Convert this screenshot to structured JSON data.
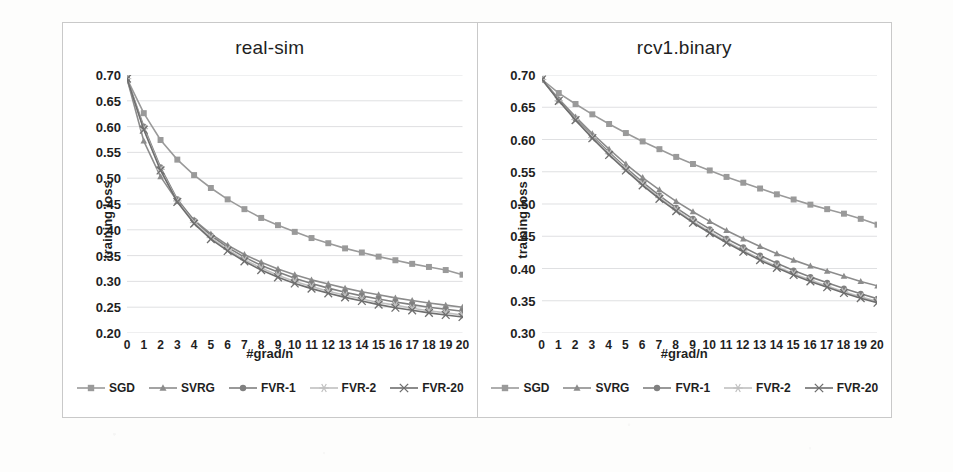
{
  "figure": {
    "panel_border_color": "#c9c9c9",
    "background": "#ffffff"
  },
  "series_style": {
    "SGD": {
      "color": "#9a9a9a",
      "marker": "square-marker"
    },
    "SVRG": {
      "color": "#8c8c8c",
      "marker": "triangle-marker"
    },
    "FVR-1": {
      "color": "#808080",
      "marker": "circle-marker"
    },
    "FVR-2": {
      "color": "#c0c0c0",
      "marker": "star-marker"
    },
    "FVR-20": {
      "color": "#6e6e6e",
      "marker": "x-marker"
    }
  },
  "legend": {
    "items": [
      {
        "label": "SGD",
        "marker": "square-marker",
        "color": "#9a9a9a"
      },
      {
        "label": "SVRG",
        "marker": "triangle-marker",
        "color": "#8c8c8c"
      },
      {
        "label": "FVR-1",
        "marker": "circle-marker",
        "color": "#808080"
      },
      {
        "label": "FVR-2",
        "marker": "star-marker",
        "color": "#c0c0c0"
      },
      {
        "label": "FVR-20",
        "marker": "x-marker",
        "color": "#6e6e6e"
      }
    ]
  },
  "chart_data": [
    {
      "type": "line",
      "title": "real-sim",
      "xlabel": "#grad/n",
      "ylabel": "training loss",
      "x": [
        0,
        1,
        2,
        3,
        4,
        5,
        6,
        7,
        8,
        9,
        10,
        11,
        12,
        13,
        14,
        15,
        16,
        17,
        18,
        19,
        20
      ],
      "xlim": [
        0,
        20
      ],
      "ylim": [
        0.2,
        0.7
      ],
      "yticks": [
        0.2,
        0.25,
        0.3,
        0.35,
        0.4,
        0.45,
        0.5,
        0.55,
        0.6,
        0.65,
        0.7
      ],
      "ytick_labels": [
        "0.20",
        "0.25",
        "0.30",
        "0.35",
        "0.40",
        "0.45",
        "0.50",
        "0.55",
        "0.60",
        "0.65",
        "0.70"
      ],
      "xtick_labels": [
        "0",
        "1",
        "2",
        "3",
        "4",
        "5",
        "6",
        "7",
        "8",
        "9",
        "10",
        "11",
        "12",
        "13",
        "14",
        "15",
        "16",
        "17",
        "18",
        "19",
        "20"
      ],
      "grid": true,
      "legend_position": "bottom",
      "series": [
        {
          "name": "SGD",
          "values": [
            0.693,
            0.626,
            0.574,
            0.536,
            0.506,
            0.481,
            0.459,
            0.44,
            0.423,
            0.409,
            0.396,
            0.384,
            0.374,
            0.364,
            0.356,
            0.348,
            0.341,
            0.334,
            0.328,
            0.322,
            0.313
          ]
        },
        {
          "name": "SVRG",
          "values": [
            0.693,
            0.572,
            0.503,
            0.455,
            0.419,
            0.392,
            0.37,
            0.352,
            0.337,
            0.324,
            0.313,
            0.303,
            0.295,
            0.287,
            0.28,
            0.274,
            0.268,
            0.263,
            0.258,
            0.254,
            0.25
          ]
        },
        {
          "name": "FVR-1",
          "values": [
            0.693,
            0.6,
            0.521,
            0.459,
            0.418,
            0.389,
            0.366,
            0.347,
            0.331,
            0.318,
            0.306,
            0.296,
            0.287,
            0.279,
            0.272,
            0.266,
            0.26,
            0.255,
            0.25,
            0.246,
            0.242
          ]
        },
        {
          "name": "FVR-2",
          "values": [
            0.693,
            0.596,
            0.517,
            0.456,
            0.414,
            0.385,
            0.362,
            0.342,
            0.326,
            0.312,
            0.3,
            0.29,
            0.281,
            0.273,
            0.266,
            0.259,
            0.254,
            0.248,
            0.243,
            0.239,
            0.235
          ]
        },
        {
          "name": "FVR-20",
          "values": [
            0.693,
            0.594,
            0.515,
            0.454,
            0.412,
            0.382,
            0.359,
            0.339,
            0.322,
            0.308,
            0.296,
            0.286,
            0.277,
            0.269,
            0.262,
            0.255,
            0.249,
            0.244,
            0.239,
            0.235,
            0.231
          ]
        }
      ]
    },
    {
      "type": "line",
      "title": "rcv1.binary",
      "xlabel": "#grad/n",
      "ylabel": "training loss",
      "x": [
        0,
        1,
        2,
        3,
        4,
        5,
        6,
        7,
        8,
        9,
        10,
        11,
        12,
        13,
        14,
        15,
        16,
        17,
        18,
        19,
        20
      ],
      "xlim": [
        0,
        20
      ],
      "ylim": [
        0.3,
        0.7
      ],
      "yticks": [
        0.3,
        0.35,
        0.4,
        0.45,
        0.5,
        0.55,
        0.6,
        0.65,
        0.7
      ],
      "ytick_labels": [
        "0.30",
        "0.35",
        "0.40",
        "0.45",
        "0.50",
        "0.55",
        "0.60",
        "0.65",
        "0.70"
      ],
      "xtick_labels": [
        "0",
        "1",
        "2",
        "3",
        "4",
        "5",
        "6",
        "7",
        "8",
        "9",
        "10",
        "11",
        "12",
        "13",
        "14",
        "15",
        "16",
        "17",
        "18",
        "19",
        "20"
      ],
      "grid": true,
      "legend_position": "bottom",
      "series": [
        {
          "name": "SGD",
          "values": [
            0.693,
            0.672,
            0.655,
            0.639,
            0.624,
            0.61,
            0.597,
            0.585,
            0.573,
            0.562,
            0.552,
            0.542,
            0.533,
            0.524,
            0.515,
            0.507,
            0.499,
            0.492,
            0.485,
            0.477,
            0.468
          ]
        },
        {
          "name": "SVRG",
          "values": [
            0.693,
            0.663,
            0.635,
            0.609,
            0.585,
            0.562,
            0.541,
            0.522,
            0.504,
            0.488,
            0.473,
            0.459,
            0.446,
            0.434,
            0.423,
            0.413,
            0.404,
            0.396,
            0.388,
            0.38,
            0.373
          ]
        },
        {
          "name": "FVR-1",
          "values": [
            0.693,
            0.661,
            0.632,
            0.605,
            0.58,
            0.556,
            0.534,
            0.513,
            0.494,
            0.477,
            0.461,
            0.446,
            0.433,
            0.42,
            0.408,
            0.397,
            0.387,
            0.378,
            0.369,
            0.361,
            0.353
          ]
        },
        {
          "name": "FVR-2",
          "values": [
            0.693,
            0.66,
            0.631,
            0.603,
            0.578,
            0.554,
            0.531,
            0.51,
            0.491,
            0.473,
            0.457,
            0.442,
            0.428,
            0.415,
            0.403,
            0.392,
            0.382,
            0.373,
            0.364,
            0.356,
            0.349
          ]
        },
        {
          "name": "FVR-20",
          "values": [
            0.693,
            0.66,
            0.63,
            0.602,
            0.576,
            0.552,
            0.529,
            0.508,
            0.489,
            0.471,
            0.455,
            0.44,
            0.426,
            0.413,
            0.401,
            0.39,
            0.38,
            0.371,
            0.362,
            0.354,
            0.347
          ]
        }
      ]
    }
  ]
}
